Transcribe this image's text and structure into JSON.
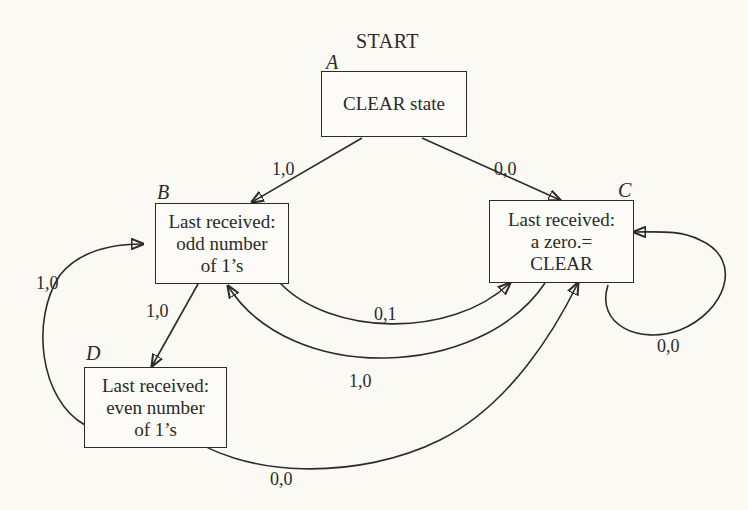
{
  "diagram": {
    "type": "state-transition diagram",
    "start_label": "START",
    "states": [
      {
        "id": "A",
        "letter": "A",
        "lines": [
          "CLEAR state"
        ]
      },
      {
        "id": "B",
        "letter": "B",
        "lines": [
          "Last received:",
          "odd number",
          "of 1’s"
        ]
      },
      {
        "id": "C",
        "letter": "C",
        "lines": [
          "Last received:",
          "a zero.=",
          "CLEAR"
        ]
      },
      {
        "id": "D",
        "letter": "D",
        "lines": [
          "Last received:",
          "even number",
          "of 1’s"
        ]
      }
    ],
    "transitions": [
      {
        "from": "A",
        "to": "B",
        "label": "1,0"
      },
      {
        "from": "A",
        "to": "C",
        "label": "0,0"
      },
      {
        "from": "C",
        "to": "C",
        "label": "0,0"
      },
      {
        "from": "B",
        "to": "C",
        "label": "0,1"
      },
      {
        "from": "C",
        "to": "B",
        "label": "1,0"
      },
      {
        "from": "B",
        "to": "D",
        "label": "1,0"
      },
      {
        "from": "D",
        "to": "B",
        "label": "1,0"
      },
      {
        "from": "D",
        "to": "C",
        "label": "0,0"
      }
    ]
  }
}
